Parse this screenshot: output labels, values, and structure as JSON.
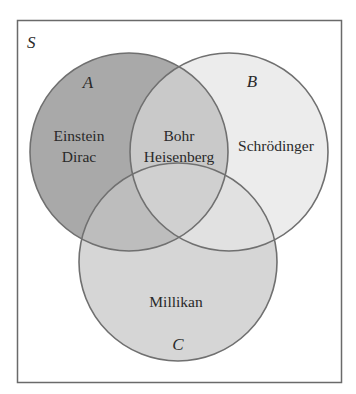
{
  "diagram": {
    "type": "venn",
    "universe": {
      "label": "S"
    },
    "sets": [
      {
        "id": "A",
        "label": "A",
        "fill": "#a9a9a9"
      },
      {
        "id": "B",
        "label": "B",
        "fill": "#ececec"
      },
      {
        "id": "C",
        "label": "C",
        "fill": "#d6d6d6"
      }
    ],
    "regions": {
      "A_only": [
        "Einstein",
        "Dirac"
      ],
      "A_and_B": [
        "Bohr",
        "Heisenberg"
      ],
      "B_only": [
        "Schrödinger"
      ],
      "C_only": [
        "Millikan"
      ]
    },
    "colors": {
      "border": "#6a6a6a",
      "circle_stroke": "#707070",
      "text": "#2a2a2a",
      "A_fill": "#a9a9a9",
      "B_fill": "#ececec",
      "C_fill": "#d6d6d6",
      "AB_fill": "#c9c9c9",
      "AC_fill": "#bdbdbd",
      "BC_fill": "#e1e1e1",
      "ABC_fill": "#d0d0d0"
    }
  }
}
